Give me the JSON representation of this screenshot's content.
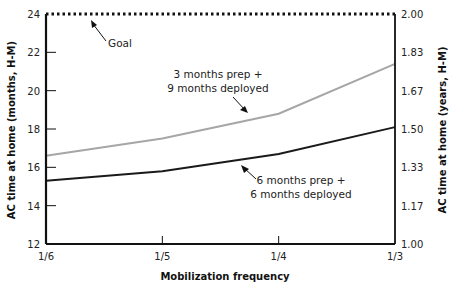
{
  "chart_data": {
    "type": "line",
    "title": "",
    "xlabel": "Mobilization frequency",
    "ylabel": "AC time at home (months, H-M)",
    "ylabel_right": "AC time at home (years, H-M)",
    "categories": [
      "1/6",
      "1/5",
      "1/4",
      "1/3"
    ],
    "ylim": [
      12,
      24
    ],
    "yticks": [
      12,
      14,
      16,
      18,
      20,
      22,
      24
    ],
    "yticks_right": [
      "1.00",
      "1.17",
      "1.33",
      "1.50",
      "1.67",
      "1.83",
      "2.00"
    ],
    "ylim_right": [
      1.0,
      2.0
    ],
    "grid": false,
    "series": [
      {
        "name": "3 months prep + 9 months deployed",
        "color": "#a6a6a6",
        "values": [
          16.6,
          17.5,
          18.8,
          21.4
        ]
      },
      {
        "name": "6 months prep + 6 months deployed",
        "color": "#1a1a1a",
        "values": [
          15.3,
          15.8,
          16.7,
          18.1
        ]
      },
      {
        "name": "Goal",
        "color": "#111111",
        "style": "dotted",
        "values": [
          24,
          24,
          24,
          24
        ]
      }
    ],
    "annotations": [
      {
        "text": "Goal",
        "target": "goal-line"
      },
      {
        "text_line1": "3 months prep +",
        "text_line2": "9 months deployed",
        "target": "series-0"
      },
      {
        "text_line1": "6 months prep +",
        "text_line2": "6 months deployed",
        "target": "series-1"
      }
    ]
  }
}
